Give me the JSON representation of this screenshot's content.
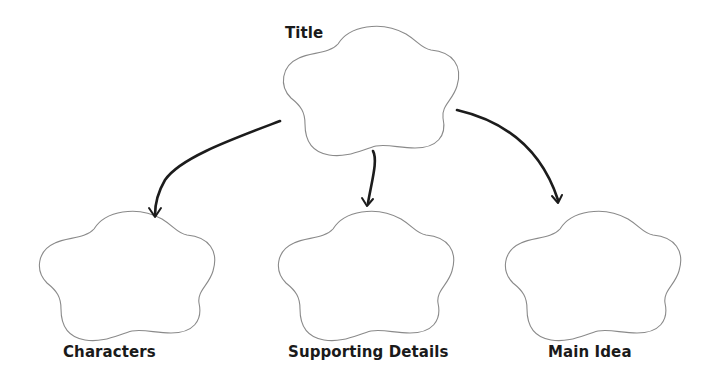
{
  "diagram": {
    "type": "graphic-organizer",
    "nodes": [
      {
        "id": "title",
        "label": "Title"
      },
      {
        "id": "characters",
        "label": "Characters"
      },
      {
        "id": "supporting_details",
        "label": "Supporting Details"
      },
      {
        "id": "main_idea",
        "label": "Main Idea"
      }
    ],
    "edges": [
      {
        "from": "title",
        "to": "characters"
      },
      {
        "from": "title",
        "to": "supporting_details"
      },
      {
        "from": "title",
        "to": "main_idea"
      }
    ]
  },
  "labels": {
    "title": "Title",
    "characters": "Characters",
    "supporting_details": "Supporting Details",
    "main_idea": "Main Idea"
  },
  "colors": {
    "background": "#ffffff",
    "cloud_outline": "#8a8a8a",
    "arrow": "#1c1c1c",
    "text": "#1a1a1a"
  }
}
